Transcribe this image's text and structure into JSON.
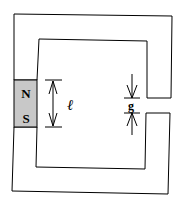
{
  "diagram": {
    "magnet": {
      "north_label": "N",
      "south_label": "S",
      "fill": "#c8c8c8"
    },
    "length_label": "ℓ",
    "gap_label": "g",
    "stroke": "#000000"
  }
}
